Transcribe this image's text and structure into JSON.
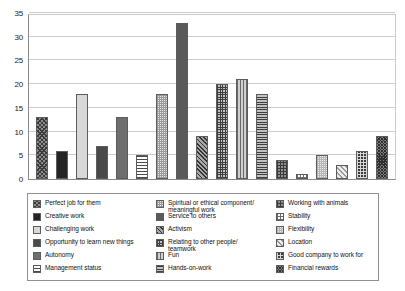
{
  "chart_data": {
    "type": "bar",
    "title": "",
    "subtitle": "",
    "xlabel": "",
    "ylabel": "",
    "ylim": [
      0,
      35
    ],
    "ytick_labels": [
      "0",
      "5",
      "10",
      "15",
      "20",
      "25",
      "30",
      "35"
    ],
    "ytick_values": [
      0,
      5,
      10,
      15,
      20,
      25,
      30,
      35
    ],
    "grid": "horizontal",
    "legend_position": "bottom",
    "legend_columns": 3,
    "xtick_labels": [],
    "categories": [
      "Perfect job for them",
      "Creative work",
      "Challenging work",
      "Opportunity to learn new things",
      "Autonomy",
      "Management status",
      "Spiritual or ethical component/\nmeaningful work",
      "Service to others",
      "Activism",
      "Relating to other people/\nteamwork",
      "Fun",
      "Hands-on-work",
      "Working with animals",
      "Stability",
      "Flexibility",
      "Location",
      "Good company to work for",
      "Financial rewards"
    ],
    "values": [
      13,
      6,
      18,
      7,
      13,
      5,
      18,
      33,
      9,
      20,
      21,
      18,
      4,
      1,
      5,
      3,
      6,
      9
    ],
    "patterns": [
      "crosshatch-dark",
      "solid-black",
      "light-gray",
      "dark-gray",
      "med-gray",
      "hstripe-light",
      "check-light",
      "solid-dkgray",
      "diag-dark",
      "check-dark",
      "vstripe",
      "hstripe-dark",
      "grid-gray",
      "grid-open",
      "dots-light",
      "diag-light",
      "grid-black",
      "crosshatch-dense"
    ]
  },
  "legend": {
    "columns": [
      {
        "items": [
          {
            "label": "Perfect job for them",
            "pattern": "crosshatch-dark"
          },
          {
            "label": "Creative work",
            "pattern": "solid-black"
          },
          {
            "label": "Challenging work",
            "pattern": "light-gray"
          },
          {
            "label": "Opportunity to learn new things",
            "pattern": "dark-gray"
          },
          {
            "label": "Autonomy",
            "pattern": "med-gray"
          },
          {
            "label": "Management status",
            "pattern": "hstripe-light"
          }
        ]
      },
      {
        "items": [
          {
            "label": "Spiritual or ethical component/\n    meaningful work",
            "pattern": "check-light"
          },
          {
            "label": "Service to others",
            "pattern": "solid-dkgray"
          },
          {
            "label": "Activism",
            "pattern": "diag-dark"
          },
          {
            "label": "Relating to other people/\n    teamwork",
            "pattern": "check-dark"
          },
          {
            "label": "Fun",
            "pattern": "vstripe"
          },
          {
            "label": "Hands-on-work",
            "pattern": "hstripe-dark"
          }
        ]
      },
      {
        "items": [
          {
            "label": "Working with animals",
            "pattern": "grid-gray"
          },
          {
            "label": "Stability",
            "pattern": "grid-open"
          },
          {
            "label": "Flexibility",
            "pattern": "dots-light"
          },
          {
            "label": "Location",
            "pattern": "diag-light"
          },
          {
            "label": "Good company to work for",
            "pattern": "grid-black"
          },
          {
            "label": "Financial rewards",
            "pattern": "crosshatch-dense"
          }
        ]
      }
    ]
  },
  "colors": {
    "background": "#ffffff",
    "gridline": "#cccccc",
    "axis": "#8a8a8a",
    "text": "#111111",
    "legend_border": "#8f8f8f"
  }
}
